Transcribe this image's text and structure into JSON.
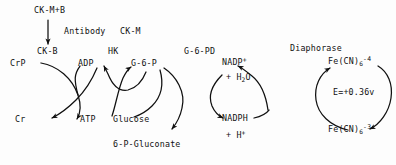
{
  "diagram": {
    "background_color": "#fdfdfd",
    "ink_color": "#101010",
    "top": {
      "analyte_label": "CK-M+B",
      "antibody_label": "Antibody",
      "inhibited_label": "CK-M",
      "product_label": "CK-B"
    },
    "enzymes": [
      {
        "name": "hk-label",
        "label": "HK"
      },
      {
        "name": "g6pd-label",
        "label": "G-6-PD"
      },
      {
        "name": "diaphorase-label",
        "label": "Diaphorase"
      }
    ],
    "potential_label": "E=+0.36v",
    "species": [
      {
        "name": "crp",
        "label": "CrP"
      },
      {
        "name": "cr",
        "label": "Cr"
      },
      {
        "name": "adp",
        "label": "ADP"
      },
      {
        "name": "atp",
        "label": "ATP"
      },
      {
        "name": "g6p",
        "label": "G-6-P"
      },
      {
        "name": "glucose",
        "label": "Glucose"
      },
      {
        "name": "6p-gluconate",
        "label": "6-P-Gluconate"
      },
      {
        "name": "nadp-plus",
        "label": "NADP"
      },
      {
        "name": "water",
        "label": "+ H"
      },
      {
        "name": "nadph",
        "label": "NADPH"
      },
      {
        "name": "proton",
        "label": "+ H"
      },
      {
        "name": "ferrocyanide",
        "label": "Fe(CN)"
      },
      {
        "name": "ferricyanide",
        "label": "Fe(CN)"
      }
    ],
    "charges": {
      "nadp_plus": "+",
      "water_sub": "2",
      "water_tail": "O",
      "proton_sup": "+",
      "ferro_sub": "6",
      "ferro_sup": "-4",
      "ferri_sub": "6",
      "ferri_sup": "-3"
    }
  }
}
